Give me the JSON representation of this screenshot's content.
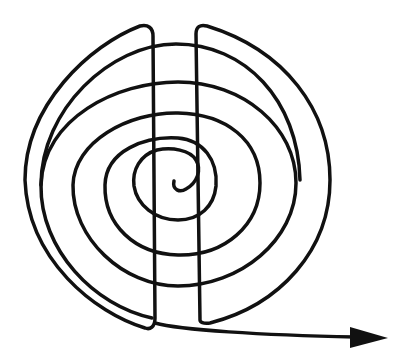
{
  "diagram": {
    "title": "",
    "colors": {
      "stroke": "#111111",
      "background": "#ffffff"
    },
    "stroke_width": 3.5,
    "elements": [
      {
        "name": "spiral",
        "type": "spiral-path"
      },
      {
        "name": "left-vertical-line",
        "type": "line"
      },
      {
        "name": "right-vertical-line",
        "type": "line"
      },
      {
        "name": "outer-left-arc",
        "type": "arc"
      },
      {
        "name": "outer-right-arc",
        "type": "arc"
      },
      {
        "name": "exit-arrow",
        "type": "arrow",
        "direction": "right"
      }
    ]
  }
}
